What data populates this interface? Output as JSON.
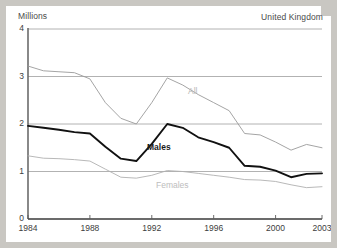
{
  "figure": {
    "units_label": "Millions",
    "region_label": "United Kingdom"
  },
  "labels": {
    "all": "All",
    "males": "Males",
    "females": "Females"
  },
  "colors": {
    "background": "#c9c7c2",
    "panel": "#ffffff",
    "all_line": "#9a9a9a",
    "males_line": "#111111",
    "females_line": "#b0b0b0",
    "grid": "#9e9e9e",
    "axis": "#6b6b6b",
    "text": "#3d3d3d"
  },
  "chart_data": {
    "type": "line",
    "title": "",
    "subtitle": "",
    "xlabel": "",
    "ylabel": "Millions",
    "annotations": [
      "United Kingdom"
    ],
    "xlim": [
      1984,
      2003
    ],
    "ylim": [
      0,
      4
    ],
    "yticks": [
      0,
      1,
      2,
      3,
      4
    ],
    "ytick_labels": [
      "0",
      "1",
      "2",
      "3",
      "4"
    ],
    "xticks": [
      1984,
      1988,
      1992,
      1996,
      2000,
      2003
    ],
    "xtick_labels": [
      "1984",
      "1988",
      "1992",
      "1996",
      "2000",
      "2003"
    ],
    "grid": true,
    "legend": "inline-series-labels",
    "x": [
      1984,
      1985,
      1986,
      1987,
      1988,
      1989,
      1990,
      1991,
      1992,
      1993,
      1994,
      1995,
      1996,
      1997,
      1998,
      1999,
      2000,
      2001,
      2002,
      2003
    ],
    "series": [
      {
        "name": "All",
        "color": "#9a9a9a",
        "values": [
          3.22,
          3.12,
          3.1,
          3.08,
          2.95,
          2.45,
          2.12,
          2.0,
          2.45,
          2.97,
          2.82,
          2.62,
          2.45,
          2.28,
          1.8,
          1.77,
          1.62,
          1.45,
          1.57,
          1.5
        ]
      },
      {
        "name": "Males",
        "color": "#111111",
        "values": [
          1.96,
          1.92,
          1.88,
          1.83,
          1.8,
          1.52,
          1.27,
          1.22,
          1.58,
          2.0,
          1.92,
          1.72,
          1.62,
          1.5,
          1.12,
          1.1,
          1.02,
          0.88,
          0.95,
          0.96
        ]
      },
      {
        "name": "Females",
        "color": "#b0b0b0",
        "values": [
          1.33,
          1.28,
          1.27,
          1.25,
          1.22,
          1.05,
          0.88,
          0.86,
          0.92,
          1.02,
          1.0,
          0.96,
          0.92,
          0.88,
          0.83,
          0.82,
          0.79,
          0.72,
          0.66,
          0.68
        ]
      }
    ]
  }
}
